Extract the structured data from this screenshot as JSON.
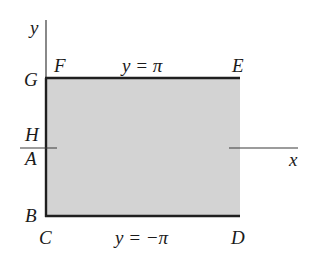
{
  "diagram": {
    "type": "rectangle-region-in-plane",
    "colors": {
      "fill": "#d3d3d3",
      "edge": "#1f1f1f",
      "axis": "#3a3a3a",
      "text": "#1a1a1a"
    },
    "axes": {
      "x_label": "x",
      "y_label": "y"
    },
    "vertices": {
      "A": "A",
      "B": "B",
      "C": "C",
      "D": "D",
      "E": "E",
      "F": "F",
      "G": "G",
      "H": "H"
    },
    "boundary_labels": {
      "top": "y = π",
      "bottom": "y = −π"
    }
  }
}
